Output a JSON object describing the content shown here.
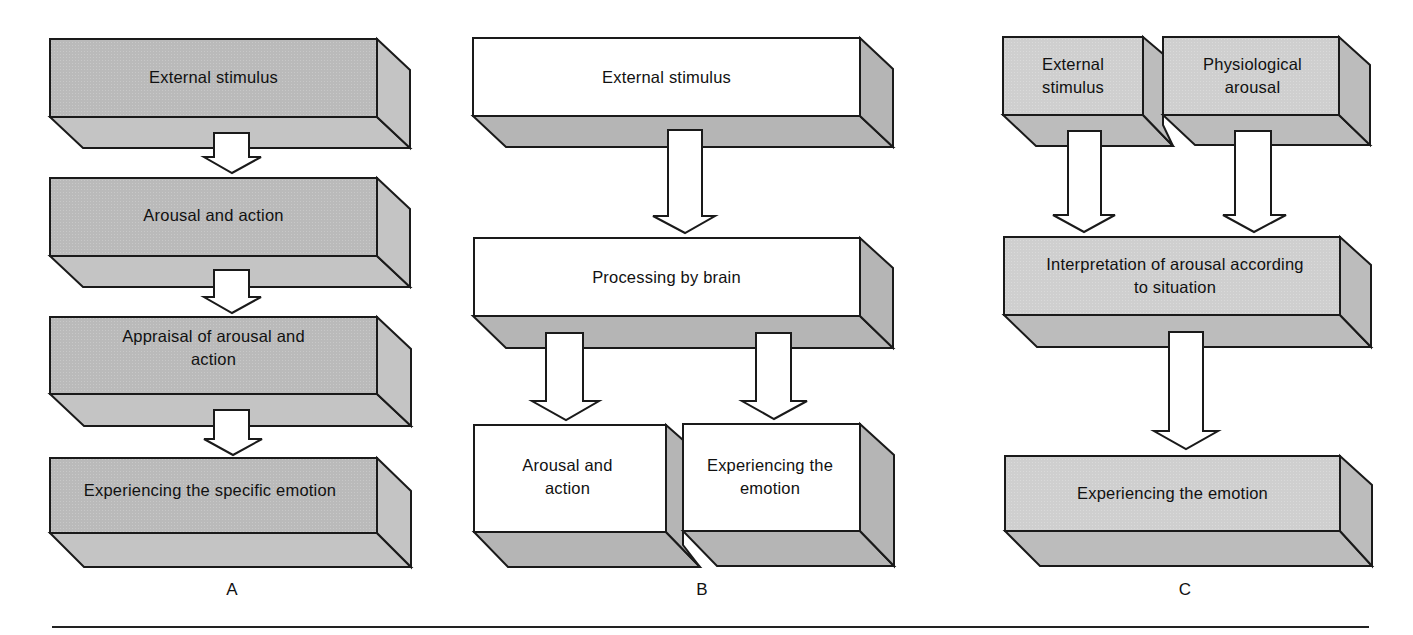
{
  "colors": {
    "panel_a_front": "#b9b9b9",
    "panel_a_side": "#c6c6c6",
    "panel_b_front": "#ffffff",
    "panel_b_side": "#b5b5b5",
    "panel_c_front": "#cfcfcf",
    "panel_c_side": "#bdbdbd",
    "stroke": "#1a1a1a",
    "arrow_fill": "#ffffff"
  },
  "panels": [
    {
      "letter": "A",
      "theory": "James-Lange",
      "boxes": [
        {
          "id": "a1",
          "text": "External stimulus"
        },
        {
          "id": "a2",
          "text": "Arousal and action"
        },
        {
          "id": "a3",
          "text": "Appraisal of arousal and action"
        },
        {
          "id": "a4",
          "text": "Experiencing the specific emotion"
        }
      ],
      "arrows": [
        [
          "a1",
          "a2"
        ],
        [
          "a2",
          "a3"
        ],
        [
          "a3",
          "a4"
        ]
      ]
    },
    {
      "letter": "B",
      "boxes": [
        {
          "id": "b1",
          "text": "External stimulus"
        },
        {
          "id": "b2",
          "text": "Processing by brain"
        },
        {
          "id": "b3",
          "text": "Arousal and action"
        },
        {
          "id": "b4",
          "text": "Experiencing the emotion"
        }
      ],
      "arrows": [
        [
          "b1",
          "b2"
        ],
        [
          "b2",
          "b3"
        ],
        [
          "b2",
          "b4"
        ]
      ]
    },
    {
      "letter": "C",
      "boxes": [
        {
          "id": "c1",
          "text": "External stimulus"
        },
        {
          "id": "c2",
          "text": "Physiological arousal"
        },
        {
          "id": "c3",
          "text": "Interpretation of arousal according to situation"
        },
        {
          "id": "c4",
          "text": "Experiencing the emotion"
        }
      ],
      "arrows": [
        [
          "c1",
          "c3"
        ],
        [
          "c2",
          "c3"
        ],
        [
          "c3",
          "c4"
        ]
      ]
    }
  ]
}
